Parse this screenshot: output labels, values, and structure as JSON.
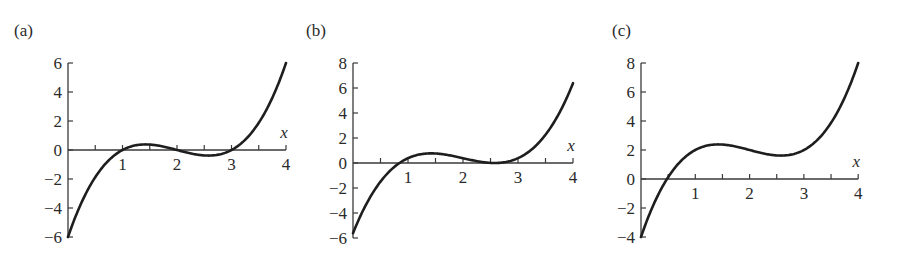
{
  "chart_data": [
    {
      "type": "line",
      "panel_label": "(a)",
      "title": "",
      "xlabel": "x",
      "ylabel": "",
      "function": "(x-1)(x-2)(x-3)",
      "xlim": [
        0,
        4
      ],
      "ylim": [
        -6,
        6
      ],
      "x_ticks": [
        0.5,
        1,
        1.5,
        2,
        2.5,
        3,
        3.5,
        4
      ],
      "x_tick_labels": [
        "1",
        "2",
        "3",
        "4"
      ],
      "x_tick_label_values": [
        1,
        2,
        3,
        4
      ],
      "y_ticks": [
        -6,
        -4,
        -2,
        0,
        2,
        4,
        6
      ],
      "y_tick_labels": [
        "−6",
        "−4",
        "−2",
        "0",
        "2",
        "4",
        "6"
      ],
      "grid": false,
      "legend": null,
      "series": [
        {
          "name": "f(x)",
          "x": [
            0,
            0.25,
            0.5,
            0.75,
            1,
            1.25,
            1.5,
            1.75,
            2,
            2.25,
            2.5,
            2.75,
            3,
            3.25,
            3.5,
            3.75,
            4
          ],
          "y": [
            -6,
            -3.28,
            -1.88,
            -0.66,
            0,
            0.33,
            0.38,
            0.23,
            0,
            -0.23,
            -0.38,
            -0.33,
            0,
            0.66,
            1.88,
            3.28,
            6
          ]
        }
      ],
      "layout": {
        "origin_px": [
          68,
          150
        ],
        "x_scale_px": 54.5,
        "y_scale_px": 14.5,
        "y_top_px": 63,
        "y_bottom_px": 237,
        "label_pos": [
          14,
          30
        ]
      }
    },
    {
      "type": "line",
      "panel_label": "(b)",
      "title": "",
      "xlabel": "x",
      "ylabel": "",
      "function": "(x-1)(x-2)(x-3) + 0.385",
      "xlim": [
        0,
        4
      ],
      "ylim": [
        -6,
        8
      ],
      "x_ticks": [
        0.5,
        1,
        1.5,
        2,
        2.5,
        3,
        3.5,
        4
      ],
      "x_tick_labels": [
        "1",
        "2",
        "3",
        "4"
      ],
      "x_tick_label_values": [
        1,
        2,
        3,
        4
      ],
      "y_ticks": [
        -6,
        -4,
        -2,
        0,
        2,
        4,
        6,
        8
      ],
      "y_tick_labels": [
        "−6",
        "−4",
        "−2",
        "0",
        "2",
        "4",
        "6",
        "8"
      ],
      "grid": false,
      "legend": null,
      "series": [
        {
          "name": "f(x)",
          "x": [
            0,
            0.25,
            0.5,
            0.75,
            1,
            1.25,
            1.5,
            1.75,
            2,
            2.25,
            2.5,
            2.75,
            3,
            3.25,
            3.5,
            3.75,
            4
          ],
          "y": [
            -5.62,
            -2.9,
            -1.49,
            -0.27,
            0.39,
            0.71,
            0.76,
            0.62,
            0.39,
            0.15,
            0.01,
            0.06,
            0.39,
            1.04,
            2.26,
            3.67,
            6.39
          ]
        }
      ],
      "layout": {
        "origin_px": [
          353,
          163
        ],
        "x_scale_px": 55,
        "y_scale_px": 12.5,
        "y_top_px": 63,
        "y_bottom_px": 238,
        "label_pos": [
          306,
          30
        ]
      }
    },
    {
      "type": "line",
      "panel_label": "(c)",
      "title": "",
      "xlabel": "x",
      "ylabel": "",
      "function": "(x-1)(x-2)(x-3) + 2",
      "xlim": [
        0,
        4
      ],
      "ylim": [
        -4,
        8
      ],
      "x_ticks": [
        0.5,
        1,
        1.5,
        2,
        2.5,
        3,
        3.5,
        4
      ],
      "x_tick_labels": [
        "1",
        "2",
        "3",
        "4"
      ],
      "x_tick_label_values": [
        1,
        2,
        3,
        4
      ],
      "y_ticks": [
        -4,
        -2,
        0,
        2,
        4,
        6,
        8
      ],
      "y_tick_labels": [
        "−4",
        "−2",
        "0",
        "2",
        "4",
        "6",
        "8"
      ],
      "grid": false,
      "legend": null,
      "series": [
        {
          "name": "f(x)",
          "x": [
            0,
            0.25,
            0.5,
            0.75,
            1,
            1.25,
            1.5,
            1.75,
            2,
            2.25,
            2.5,
            2.75,
            3,
            3.25,
            3.5,
            3.75,
            4
          ],
          "y": [
            -4,
            -1.28,
            0.13,
            1.34,
            2,
            2.33,
            2.38,
            2.23,
            2,
            1.77,
            1.63,
            1.67,
            2,
            2.66,
            3.88,
            5.28,
            8
          ]
        }
      ],
      "layout": {
        "origin_px": [
          641,
          179
        ],
        "x_scale_px": 54.3,
        "y_scale_px": 14.5,
        "y_top_px": 63,
        "y_bottom_px": 237,
        "label_pos": [
          612,
          30
        ]
      }
    }
  ]
}
